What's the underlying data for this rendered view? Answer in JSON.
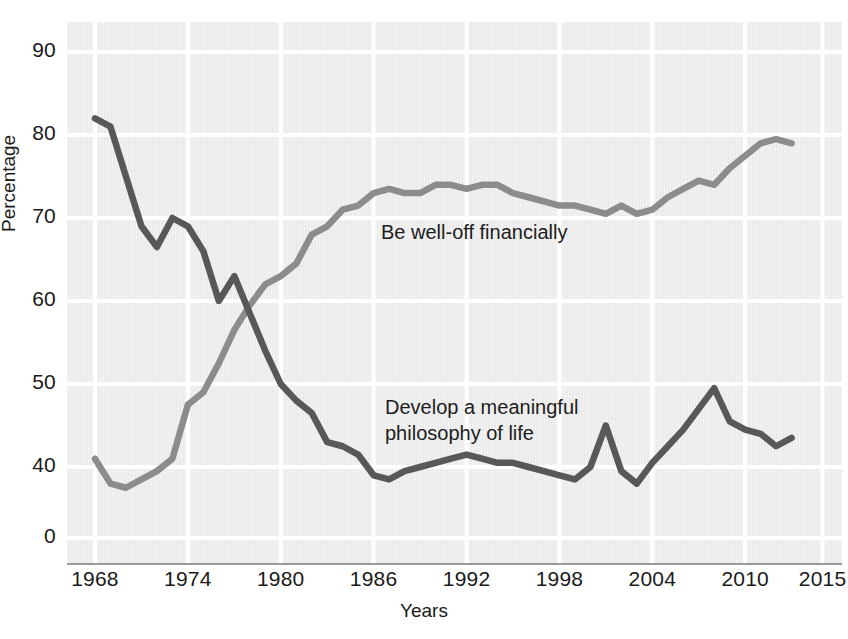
{
  "chart_data": {
    "type": "line",
    "title": "",
    "xlabel": "Years",
    "ylabel": "Percentage",
    "xlim": [
      1968,
      2015
    ],
    "ylim": [
      35,
      93
    ],
    "grid": true,
    "legend_position": "inline-annotations",
    "x_tick_labels": [
      "1968",
      "1974",
      "1980",
      "1986",
      "1992",
      "1998",
      "2004",
      "2010",
      "2015"
    ],
    "x_ticks": [
      1968,
      1974,
      1980,
      1986,
      1992,
      1998,
      2004,
      2010,
      2015
    ],
    "y_tick_labels": [
      "90",
      "80",
      "70",
      "60",
      "50",
      "40",
      "0"
    ],
    "y_ticks": [
      90,
      80,
      70,
      60,
      50,
      40,
      0
    ],
    "y_axis_break_below": 40,
    "x": [
      1968,
      1969,
      1970,
      1971,
      1972,
      1973,
      1974,
      1975,
      1976,
      1977,
      1978,
      1979,
      1980,
      1981,
      1982,
      1983,
      1984,
      1985,
      1986,
      1987,
      1988,
      1989,
      1990,
      1991,
      1992,
      1993,
      1994,
      1995,
      1996,
      1997,
      1998,
      1999,
      2000,
      2001,
      2002,
      2003,
      2004,
      2005,
      2006,
      2007,
      2008,
      2009,
      2010,
      2011,
      2012,
      2013
    ],
    "series": [
      {
        "name": "Be well-off financially",
        "label": "Be well-off financially",
        "color": "#8c8c8c",
        "values": [
          41.0,
          38.0,
          37.5,
          38.5,
          39.5,
          41.0,
          47.5,
          49.0,
          52.5,
          56.5,
          59.5,
          62.0,
          63.0,
          64.5,
          68.0,
          69.0,
          71.0,
          71.5,
          73.0,
          73.5,
          73.0,
          73.0,
          74.0,
          74.0,
          73.5,
          74.0,
          74.0,
          73.0,
          72.5,
          72.0,
          71.5,
          71.5,
          71.0,
          70.5,
          71.5,
          70.5,
          71.0,
          72.5,
          73.5,
          74.5,
          74.0,
          76.0,
          77.5,
          79.0,
          79.5,
          79.0
        ]
      },
      {
        "name": "Develop a meaningful philosophy of life",
        "label": "Develop a meaningful\nphilosophy of life",
        "color": "#585858",
        "values": [
          82.0,
          81.0,
          75.0,
          69.0,
          66.5,
          70.0,
          69.0,
          66.0,
          60.0,
          63.0,
          58.5,
          54.0,
          50.0,
          48.0,
          46.5,
          43.0,
          42.5,
          41.5,
          39.0,
          38.5,
          39.5,
          40.0,
          40.5,
          41.0,
          41.5,
          41.0,
          40.5,
          40.5,
          40.0,
          39.5,
          39.0,
          38.5,
          40.0,
          45.0,
          39.5,
          38.0,
          40.5,
          42.5,
          44.5,
          47.0,
          49.5,
          45.5,
          44.5,
          44.0,
          42.5,
          43.5
        ]
      }
    ]
  },
  "axes": {
    "y_title": "Percentage",
    "x_title": "Years"
  }
}
